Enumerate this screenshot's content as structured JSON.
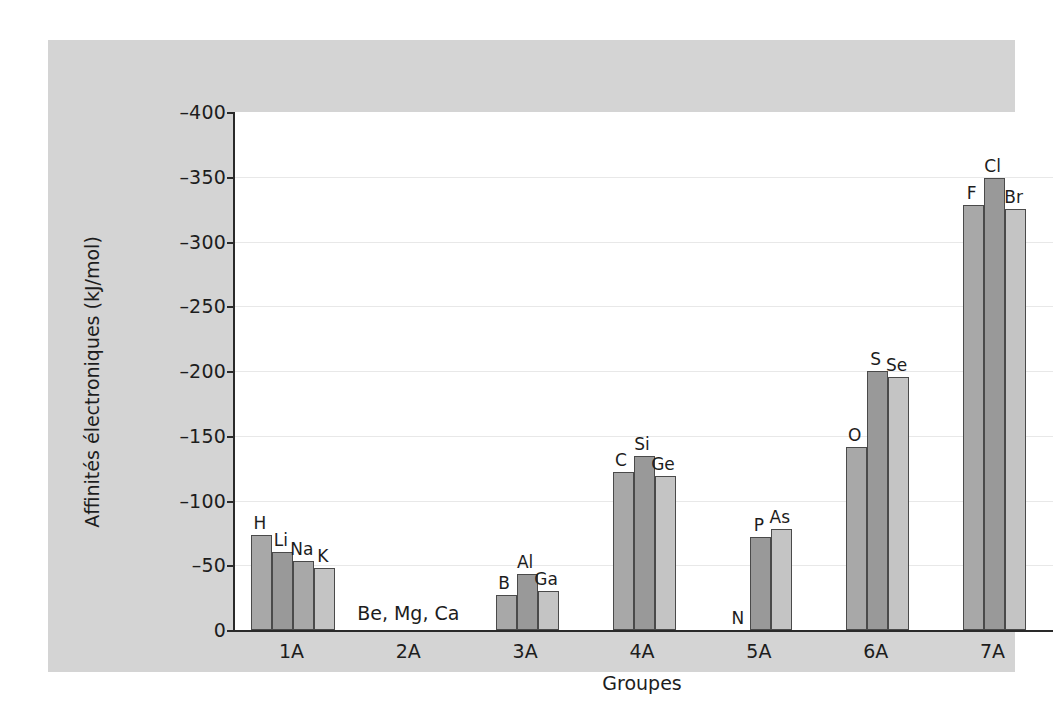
{
  "chart_data": {
    "type": "bar",
    "title": "",
    "xlabel": "Groupes",
    "ylabel": "Affinités électroniques (kJ/mol)",
    "ylim": [
      0,
      -400
    ],
    "y_inverted": true,
    "grid": true,
    "legend": "none",
    "y_ticks": [
      {
        "value": -400,
        "label": "–400"
      },
      {
        "value": -350,
        "label": "–350"
      },
      {
        "value": -300,
        "label": "–300"
      },
      {
        "value": -250,
        "label": "–250"
      },
      {
        "value": -200,
        "label": "–200"
      },
      {
        "value": -150,
        "label": "–150"
      },
      {
        "value": -100,
        "label": "–100"
      },
      {
        "value": -50,
        "label": "–50"
      },
      {
        "value": 0,
        "label": "0"
      }
    ],
    "categories": [
      "1A",
      "2A",
      "3A",
      "4A",
      "5A",
      "6A",
      "7A"
    ],
    "groups": [
      {
        "category": "1A",
        "note": "",
        "bars": [
          {
            "label": "H",
            "value": -73,
            "shade": "mid"
          },
          {
            "label": "Li",
            "value": -60,
            "shade": "dark"
          },
          {
            "label": "Na",
            "value": -53,
            "shade": "mid"
          },
          {
            "label": "K",
            "value": -48,
            "shade": "light"
          }
        ]
      },
      {
        "category": "2A",
        "note": "Be, Mg, Ca",
        "bars": []
      },
      {
        "category": "3A",
        "note": "",
        "bars": [
          {
            "label": "B",
            "value": -27,
            "shade": "mid"
          },
          {
            "label": "Al",
            "value": -43,
            "shade": "dark"
          },
          {
            "label": "Ga",
            "value": -30,
            "shade": "light"
          }
        ]
      },
      {
        "category": "4A",
        "note": "",
        "bars": [
          {
            "label": "C",
            "value": -122,
            "shade": "mid"
          },
          {
            "label": "Si",
            "value": -134,
            "shade": "dark"
          },
          {
            "label": "Ge",
            "value": -119,
            "shade": "light"
          }
        ]
      },
      {
        "category": "5A",
        "note": "",
        "bars": [
          {
            "label": "N",
            "value": 0,
            "shade": "mid"
          },
          {
            "label": "P",
            "value": -72,
            "shade": "dark"
          },
          {
            "label": "As",
            "value": -78,
            "shade": "light"
          }
        ]
      },
      {
        "category": "6A",
        "note": "",
        "bars": [
          {
            "label": "O",
            "value": -141,
            "shade": "mid"
          },
          {
            "label": "S",
            "value": -200,
            "shade": "dark"
          },
          {
            "label": "Se",
            "value": -195,
            "shade": "light"
          }
        ]
      },
      {
        "category": "7A",
        "note": "",
        "bars": [
          {
            "label": "F",
            "value": -328,
            "shade": "mid"
          },
          {
            "label": "Cl",
            "value": -349,
            "shade": "dark"
          },
          {
            "label": "Br",
            "value": -325,
            "shade": "light"
          }
        ]
      }
    ],
    "colors": {
      "bar_mid": "#a8a8a8",
      "bar_dark": "#999999",
      "bar_light": "#c4c4c4",
      "bar_edge": "#4a4a4a",
      "axis": "#2a2a2a",
      "grid": "#e8e8e8",
      "panel_background": "#d4d4d4",
      "plot_background": "#ffffff",
      "text": "#1d1d1d"
    }
  }
}
